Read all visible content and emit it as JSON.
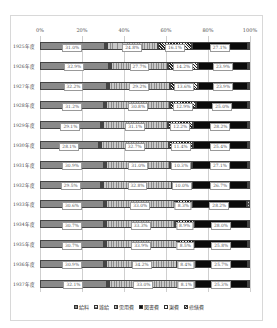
{
  "chart_data": {
    "type": "bar",
    "orientation": "horizontal",
    "stacked": "percent",
    "title": "",
    "xlabel": "",
    "ylabel": "",
    "xlim": [
      0,
      100
    ],
    "x_ticks": [
      "0%",
      "20%",
      "40%",
      "60%",
      "80%",
      "100%"
    ],
    "grid": true,
    "legend_position": "bottom",
    "categories": [
      "1925年度",
      "1926年度",
      "1927年度",
      "1928年度",
      "1929年度",
      "1930年度",
      "1931年度",
      "1932年度",
      "1933年度",
      "1934年度",
      "1935年度",
      "1936年度",
      "1937年度"
    ],
    "series": [
      {
        "name": "給料",
        "values": [
          31.0,
          32.9,
          32.2,
          31.2,
          29.1,
          28.1,
          30.9,
          29.5,
          30.6,
          30.7,
          30.7,
          30.9,
          32.1
        ],
        "labeled": true
      },
      {
        "name": "雑給",
        "values": [
          0.3,
          0.3,
          0.3,
          0.3,
          0.3,
          0.3,
          0.3,
          0.3,
          0.3,
          0.3,
          0.3,
          0.3,
          0.3
        ],
        "labeled": false
      },
      {
        "name": "需用費",
        "values": [
          24.8,
          27.7,
          29.2,
          30.8,
          31.1,
          32.7,
          31.0,
          32.8,
          33.0,
          33.3,
          33.9,
          34.2,
          33.0
        ],
        "labeled": true
      },
      {
        "name": "図書費",
        "values": [
          16.1,
          14.2,
          13.6,
          12.9,
          12.2,
          11.4,
          10.3,
          10.0,
          8.3,
          8.9,
          8.5,
          8.4,
          8.1
        ],
        "labeled": true
      },
      {
        "name": "謝費",
        "values": [
          27.1,
          23.9,
          23.9,
          25.0,
          26.2,
          26.4,
          27.1,
          26.7,
          26.2,
          26.0,
          25.8,
          25.7,
          25.3
        ],
        "labeled": true
      },
      {
        "name": "修繕費",
        "values": [
          0.7,
          1.0,
          0.8,
          0.8,
          1.1,
          1.1,
          0.4,
          0.7,
          1.6,
          0.8,
          0.8,
          0.5,
          1.2
        ],
        "labeled": false
      }
    ]
  },
  "axis": {
    "ticks": [
      "0%",
      "20%",
      "40%",
      "60%",
      "80%",
      "100%"
    ]
  },
  "legend": [
    {
      "label": "給料"
    },
    {
      "label": "雑給"
    },
    {
      "label": "需用費"
    },
    {
      "label": "図書費"
    },
    {
      "label": "謝費"
    },
    {
      "label": "修繕費"
    }
  ],
  "rows": [
    {
      "year": "1925年度",
      "labels": [
        "31.0%",
        "24.8%",
        "16.1%",
        "27.1%"
      ]
    },
    {
      "year": "1926年度",
      "labels": [
        "32.9%",
        "27.7%",
        "14.2%",
        "23.9%"
      ]
    },
    {
      "year": "1927年度",
      "labels": [
        "32.2%",
        "29.2%",
        "13.6%",
        "23.9%"
      ]
    },
    {
      "year": "1928年度",
      "labels": [
        "31.2%",
        "30.8%",
        "12.9%",
        "25.0%"
      ]
    },
    {
      "year": "1929年度",
      "labels": [
        "29.1%",
        "31.1%",
        "12.2%",
        "28.2%"
      ]
    },
    {
      "year": "1930年度",
      "labels": [
        "28.1%",
        "32.7%",
        "11.4%",
        "25.4%"
      ]
    },
    {
      "year": "1931年度",
      "labels": [
        "30.9%",
        "31.0%",
        "10.3%",
        "27.1%"
      ]
    },
    {
      "year": "1932年度",
      "labels": [
        "29.5%",
        "32.8%",
        "10.0%",
        "26.7%"
      ]
    },
    {
      "year": "1933年度",
      "labels": [
        "30.6%",
        "33.0%",
        "8.3%",
        "28.2%"
      ]
    },
    {
      "year": "1934年度",
      "labels": [
        "30.7%",
        "33.3%",
        "8.9%",
        "28.0%"
      ]
    },
    {
      "year": "1935年度",
      "labels": [
        "30.7%",
        "33.9%",
        "8.5%",
        "25.8%"
      ]
    },
    {
      "year": "1936年度",
      "labels": [
        "30.9%",
        "34.2%",
        "8.4%",
        "25.7%"
      ]
    },
    {
      "year": "1937年度",
      "labels": [
        "32.1%",
        "33.0%",
        "8.1%",
        "25.3%"
      ]
    }
  ]
}
